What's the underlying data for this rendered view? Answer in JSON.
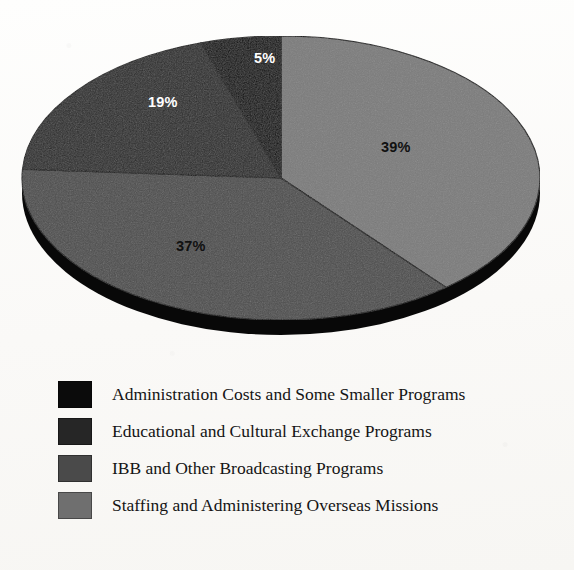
{
  "chart_data": {
    "type": "pie",
    "title": "",
    "subtitle": "",
    "xlabel": "",
    "ylabel": "",
    "grid": false,
    "legend_position": "bottom-left",
    "three_d": true,
    "start_angle_deg": 0,
    "direction": "clockwise",
    "categories": [
      "Administration Costs and Some Smaller Programs",
      "Educational and Cultural Exchange Programs",
      "IBB and Other Broadcasting Programs",
      "Staffing and Administering Overseas Missions"
    ],
    "values": [
      5,
      19,
      37,
      39
    ],
    "value_labels": [
      "5%",
      "19%",
      "37%",
      "39%"
    ],
    "colors": [
      "#080808",
      "#2b2b2b",
      "#4d4d4d",
      "#7b7b7b"
    ],
    "label_text_colors": [
      "#ffffff",
      "#ffffff",
      "#111111",
      "#111111"
    ],
    "rim_color": "#080808",
    "slices": [
      {
        "name": "Administration Costs and Some Smaller Programs",
        "value": 5,
        "label": "5%",
        "color": "#080808",
        "label_color": "#ffffff",
        "label_x": 254,
        "label_y": 57
      },
      {
        "name": "Educational and Cultural Exchange Programs",
        "value": 19,
        "label": "19%",
        "color": "#2b2b2b",
        "label_color": "#ffffff",
        "label_x": 155,
        "label_y": 100
      },
      {
        "name": "IBB and Other Broadcasting Programs",
        "value": 37,
        "label": "37%",
        "color": "#4d4d4d",
        "label_color": "#111111",
        "label_x": 183,
        "label_y": 245
      },
      {
        "name": "Staffing and Administering Overseas Missions",
        "value": 39,
        "label": "39%",
        "color": "#7b7b7b",
        "label_color": "#111111",
        "label_x": 388,
        "label_y": 145
      }
    ]
  },
  "legend": {
    "items": [
      {
        "label": "Administration Costs and Some Smaller Programs",
        "color": "#0b0b0b"
      },
      {
        "label": "Educational and Cultural Exchange Programs",
        "color": "#262626"
      },
      {
        "label": "IBB and Other Broadcasting Programs",
        "color": "#4a4a4a"
      },
      {
        "label": "Staffing and Administering Overseas Missions",
        "color": "#6f6f6f"
      }
    ]
  }
}
